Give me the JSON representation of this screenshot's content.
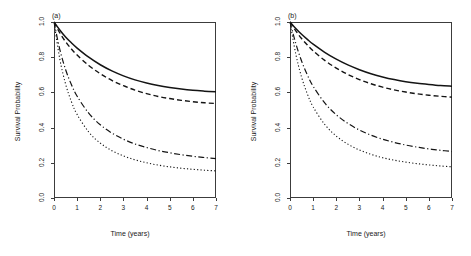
{
  "figure": {
    "panels": [
      {
        "id": "a",
        "label": "(a)",
        "xlabel": "Time (years)",
        "ylabel": "Survival Probability"
      },
      {
        "id": "b",
        "label": "(b)",
        "xlabel": "Time (years)",
        "ylabel": "Survival Probability"
      }
    ],
    "yticks": [
      "0.0",
      "0.2",
      "0.4",
      "0.6",
      "0.8",
      "1.0"
    ],
    "xticks": [
      "0",
      "1",
      "2",
      "3",
      "4",
      "5",
      "6",
      "7"
    ]
  },
  "chart_data": [
    {
      "type": "line",
      "panel": "(a)",
      "title": "(a)",
      "xlabel": "Time (years)",
      "ylabel": "Survival Probability",
      "xlim": [
        0,
        7
      ],
      "ylim": [
        0.0,
        1.0
      ],
      "xticks": [
        0,
        1,
        2,
        3,
        4,
        5,
        6,
        7
      ],
      "yticks": [
        0.0,
        0.2,
        0.4,
        0.6,
        0.8,
        1.0
      ],
      "grid": false,
      "legend": "none",
      "x": [
        0,
        0.25,
        0.5,
        0.75,
        1,
        1.5,
        2,
        2.5,
        3,
        3.5,
        4,
        4.5,
        5,
        5.5,
        6,
        6.5,
        7
      ],
      "series": [
        {
          "name": "curve-1",
          "style": "solid",
          "values": [
            1.0,
            0.955,
            0.915,
            0.882,
            0.852,
            0.8,
            0.757,
            0.722,
            0.694,
            0.671,
            0.653,
            0.639,
            0.628,
            0.619,
            0.612,
            0.607,
            0.603
          ]
        },
        {
          "name": "curve-2",
          "style": "dashed",
          "values": [
            1.0,
            0.938,
            0.888,
            0.847,
            0.812,
            0.753,
            0.706,
            0.668,
            0.638,
            0.613,
            0.593,
            0.577,
            0.565,
            0.555,
            0.547,
            0.541,
            0.537
          ]
        },
        {
          "name": "curve-3",
          "style": "dashdot",
          "values": [
            1.0,
            0.845,
            0.73,
            0.645,
            0.578,
            0.482,
            0.416,
            0.369,
            0.334,
            0.307,
            0.287,
            0.27,
            0.257,
            0.246,
            0.237,
            0.23,
            0.224
          ]
        },
        {
          "name": "curve-4",
          "style": "dotted",
          "values": [
            1.0,
            0.79,
            0.648,
            0.548,
            0.474,
            0.375,
            0.312,
            0.269,
            0.239,
            0.217,
            0.2,
            0.187,
            0.177,
            0.169,
            0.163,
            0.158,
            0.154
          ]
        }
      ]
    },
    {
      "type": "line",
      "panel": "(b)",
      "title": "(b)",
      "xlabel": "Time (years)",
      "ylabel": "Survival Probability",
      "xlim": [
        0,
        7
      ],
      "ylim": [
        0.0,
        1.0
      ],
      "xticks": [
        0,
        1,
        2,
        3,
        4,
        5,
        6,
        7
      ],
      "yticks": [
        0.0,
        0.2,
        0.4,
        0.6,
        0.8,
        1.0
      ],
      "grid": false,
      "legend": "none",
      "x": [
        0,
        0.25,
        0.5,
        0.75,
        1,
        1.5,
        2,
        2.5,
        3,
        3.5,
        4,
        4.5,
        5,
        5.5,
        6,
        6.5,
        7
      ],
      "series": [
        {
          "name": "curve-1",
          "style": "solid",
          "values": [
            1.0,
            0.963,
            0.93,
            0.901,
            0.874,
            0.828,
            0.789,
            0.756,
            0.729,
            0.706,
            0.688,
            0.673,
            0.661,
            0.652,
            0.645,
            0.639,
            0.635
          ]
        },
        {
          "name": "curve-2",
          "style": "dashed",
          "values": [
            1.0,
            0.95,
            0.906,
            0.869,
            0.836,
            0.782,
            0.738,
            0.702,
            0.673,
            0.649,
            0.63,
            0.614,
            0.602,
            0.592,
            0.584,
            0.578,
            0.573
          ]
        },
        {
          "name": "curve-3",
          "style": "dashdot",
          "values": [
            1.0,
            0.878,
            0.778,
            0.699,
            0.635,
            0.54,
            0.473,
            0.424,
            0.386,
            0.357,
            0.334,
            0.316,
            0.301,
            0.289,
            0.279,
            0.271,
            0.264
          ]
        },
        {
          "name": "curve-4",
          "style": "dotted",
          "values": [
            1.0,
            0.818,
            0.687,
            0.591,
            0.518,
            0.418,
            0.352,
            0.306,
            0.273,
            0.248,
            0.229,
            0.215,
            0.204,
            0.195,
            0.188,
            0.182,
            0.177
          ]
        }
      ]
    }
  ]
}
